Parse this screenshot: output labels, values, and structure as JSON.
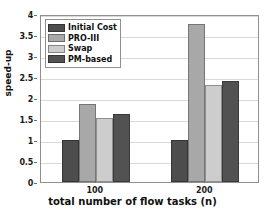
{
  "chart_data": {
    "type": "bar",
    "title": "",
    "xlabel": "total number of flow tasks (n)",
    "ylabel": "speed-up",
    "categories": [
      "100",
      "200"
    ],
    "series": [
      {
        "name": "Initial Cost",
        "color": "#4d4d4d",
        "values": [
          1.0,
          0.99
        ]
      },
      {
        "name": "PRO-III",
        "color": "#a8a8a8",
        "values": [
          1.86,
          3.76
        ]
      },
      {
        "name": "Swap",
        "color": "#cdcdcd",
        "values": [
          1.52,
          2.3
        ]
      },
      {
        "name": "PM-based",
        "color": "#525252",
        "values": [
          1.61,
          2.41
        ]
      }
    ],
    "ylim": [
      0,
      4
    ],
    "yticks": [
      0,
      0.5,
      1,
      1.5,
      2,
      2.5,
      3,
      3.5,
      4
    ],
    "ytick_labels": [
      "0",
      "0.5",
      "1",
      "1.5",
      "2",
      "2.5",
      "3",
      "3.5",
      "4"
    ],
    "xtick_labels": [
      "100",
      "200"
    ],
    "grid": "horizontal",
    "legend_position": "upper-left-inside",
    "legend_entries": [
      "Initial Cost",
      "PRO-III",
      "Swap",
      "PM-based"
    ]
  }
}
